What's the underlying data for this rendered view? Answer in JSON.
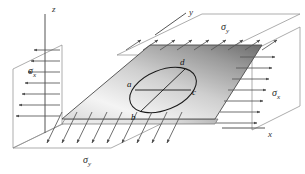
{
  "figure": {
    "type": "biaxial-stress-plate-diagram",
    "title": "",
    "background_color": "#ffffff",
    "ink_color": "#333333"
  },
  "axes": [
    {
      "name": "z-axis",
      "label": "z",
      "orientation": "vertical",
      "x": 52,
      "y": 7
    },
    {
      "name": "y-axis",
      "label": "y",
      "orientation": "diagonal",
      "x": 189,
      "y": 10
    },
    {
      "name": "x-axis",
      "label": "x",
      "orientation": "horizontal",
      "x": 268,
      "y": 130
    }
  ],
  "stress_labels": [
    {
      "name": "sigma-y-top",
      "symbol": "σ",
      "subscript": "y",
      "x": 221,
      "y": 22
    },
    {
      "name": "sigma-x-left",
      "symbol": "σ",
      "subscript": "x",
      "x": 28,
      "y": 66
    },
    {
      "name": "sigma-x-right",
      "symbol": "σ",
      "subscript": "x",
      "x": 272,
      "y": 88
    },
    {
      "name": "sigma-y-bottom",
      "symbol": "σ",
      "subscript": "y",
      "x": 83,
      "y": 155
    }
  ],
  "ellipse_points": [
    {
      "name": "point-a",
      "label": "a",
      "x": 130,
      "y": 84
    },
    {
      "name": "point-b",
      "label": "b",
      "x": 131,
      "y": 117
    },
    {
      "name": "point-c",
      "label": "c",
      "x": 192,
      "y": 92
    },
    {
      "name": "point-d",
      "label": "d",
      "x": 180,
      "y": 62
    }
  ],
  "plate": {
    "name": "stressed-plate",
    "shape": "parallelogram",
    "fill_gradient_from": "#f2f2f2",
    "fill_gradient_to": "#6e6e6e",
    "edge_color": "#4a4a4a",
    "thickness_color": "#e2e2e2"
  },
  "arrow_bands": [
    {
      "name": "band-top-sigma-y",
      "direction": "outward-up-right",
      "count": 9
    },
    {
      "name": "band-bottom-sigma-y",
      "direction": "outward-down-left",
      "count": 9
    },
    {
      "name": "band-left-sigma-x",
      "direction": "outward-left",
      "count": 7
    },
    {
      "name": "band-right-sigma-x",
      "direction": "outward-right",
      "count": 7
    }
  ]
}
